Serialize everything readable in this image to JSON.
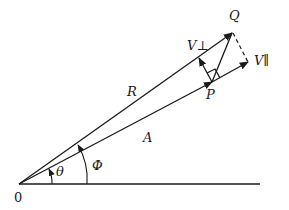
{
  "diagram": {
    "type": "vector-decomposition",
    "labels": {
      "origin": "0",
      "theta": "θ",
      "phi": "Φ",
      "R": "R",
      "A": "A",
      "P": "P",
      "Q": "Q",
      "V_perp": "V⊥",
      "V_parallel": "V∥"
    },
    "vectors": [
      {
        "name": "R",
        "from": "0",
        "to": "Q"
      },
      {
        "name": "A",
        "from": "0",
        "to": "P"
      },
      {
        "name": "V_perp",
        "from": "P",
        "direction": "perpendicular to A"
      },
      {
        "name": "V_parallel",
        "from": "P",
        "direction": "along A"
      },
      {
        "name": "PQ",
        "from": "P",
        "to": "Q"
      }
    ],
    "angles": [
      {
        "name": "theta",
        "between": [
          "horizontal axis",
          "A"
        ]
      },
      {
        "name": "phi",
        "between": [
          "horizontal axis",
          "R"
        ]
      }
    ],
    "colors": {
      "ink": "#1a1a1a",
      "background": "#ffffff"
    }
  }
}
